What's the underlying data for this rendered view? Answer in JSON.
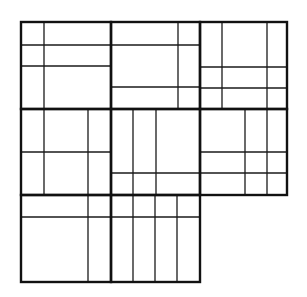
{
  "diagram": {
    "title": "",
    "type": "rectangle subdivision puzzle grid",
    "colors": {
      "background": "#ffffff",
      "line": "#111111"
    },
    "blocks": [
      {
        "id": "top-left",
        "x": 21,
        "y": 22,
        "w": 90,
        "h": 87,
        "lines": [
          {
            "x1": 44,
            "y1": 22,
            "x2": 44,
            "y2": 109
          },
          {
            "x1": 21,
            "y1": 45,
            "x2": 111,
            "y2": 45
          },
          {
            "x1": 21,
            "y1": 66,
            "x2": 111,
            "y2": 66
          }
        ]
      },
      {
        "id": "top-center",
        "x": 111,
        "y": 22,
        "w": 89,
        "h": 87,
        "lines": [
          {
            "x1": 178,
            "y1": 22,
            "x2": 178,
            "y2": 109
          },
          {
            "x1": 111,
            "y1": 45,
            "x2": 200,
            "y2": 45
          },
          {
            "x1": 111,
            "y1": 87,
            "x2": 200,
            "y2": 87
          }
        ]
      },
      {
        "id": "top-right",
        "x": 200,
        "y": 22,
        "w": 87,
        "h": 87,
        "lines": [
          {
            "x1": 222,
            "y1": 22,
            "x2": 222,
            "y2": 109
          },
          {
            "x1": 267,
            "y1": 22,
            "x2": 267,
            "y2": 109
          },
          {
            "x1": 200,
            "y1": 67,
            "x2": 287,
            "y2": 67
          },
          {
            "x1": 200,
            "y1": 88,
            "x2": 287,
            "y2": 88
          }
        ]
      },
      {
        "id": "middle-left",
        "x": 21,
        "y": 109,
        "w": 90,
        "h": 86,
        "lines": [
          {
            "x1": 44,
            "y1": 109,
            "x2": 44,
            "y2": 195
          },
          {
            "x1": 88,
            "y1": 109,
            "x2": 88,
            "y2": 195
          },
          {
            "x1": 21,
            "y1": 152,
            "x2": 111,
            "y2": 152
          }
        ]
      },
      {
        "id": "middle-center",
        "x": 111,
        "y": 109,
        "w": 89,
        "h": 86,
        "lines": [
          {
            "x1": 133,
            "y1": 109,
            "x2": 133,
            "y2": 195
          },
          {
            "x1": 156,
            "y1": 109,
            "x2": 156,
            "y2": 195
          },
          {
            "x1": 111,
            "y1": 173,
            "x2": 200,
            "y2": 173
          }
        ]
      },
      {
        "id": "middle-right",
        "x": 200,
        "y": 109,
        "w": 87,
        "h": 86,
        "lines": [
          {
            "x1": 245,
            "y1": 109,
            "x2": 245,
            "y2": 195
          },
          {
            "x1": 267,
            "y1": 109,
            "x2": 267,
            "y2": 195
          },
          {
            "x1": 200,
            "y1": 152,
            "x2": 287,
            "y2": 152
          },
          {
            "x1": 200,
            "y1": 173,
            "x2": 287,
            "y2": 173
          }
        ]
      },
      {
        "id": "bottom-left",
        "x": 21,
        "y": 195,
        "w": 90,
        "h": 87,
        "lines": [
          {
            "x1": 88,
            "y1": 195,
            "x2": 88,
            "y2": 282
          },
          {
            "x1": 21,
            "y1": 217,
            "x2": 111,
            "y2": 217
          }
        ]
      },
      {
        "id": "bottom-center",
        "x": 111,
        "y": 195,
        "w": 89,
        "h": 87,
        "lines": [
          {
            "x1": 133,
            "y1": 195,
            "x2": 133,
            "y2": 282
          },
          {
            "x1": 155,
            "y1": 195,
            "x2": 155,
            "y2": 282
          },
          {
            "x1": 177,
            "y1": 195,
            "x2": 177,
            "y2": 282
          },
          {
            "x1": 111,
            "y1": 217,
            "x2": 200,
            "y2": 217
          }
        ]
      }
    ]
  }
}
